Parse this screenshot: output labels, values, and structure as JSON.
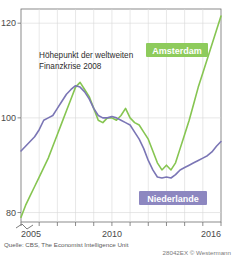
{
  "chart_data": {
    "type": "line",
    "title": "",
    "subtitle": "",
    "xlabel": "",
    "ylabel": "",
    "xlim": [
      2005,
      2016
    ],
    "ylim": [
      78,
      123
    ],
    "yticks": [
      80,
      100,
      120
    ],
    "ytick_labels": [
      "80",
      "100",
      "120"
    ],
    "xticks": [
      2005,
      2006,
      2007,
      2008,
      2009,
      2010,
      2011,
      2012,
      2013,
      2014,
      2015,
      2016
    ],
    "xtick_labels_shown": [
      "2005",
      "2010",
      "2016"
    ],
    "grid": true,
    "legend_position": "inside",
    "y_axis_break": true,
    "annotations": [
      {
        "name": "financial-crisis-note",
        "line1": "Höhepunkt der weltweiten",
        "line2": "Finanzkrise 2008"
      }
    ],
    "series": [
      {
        "name": "Amsterdam",
        "color": "#86c551",
        "label_bg": "#8ecb5c",
        "x": [
          2005.0,
          2005.25,
          2005.5,
          2005.75,
          2006.0,
          2006.25,
          2006.5,
          2006.75,
          2007.0,
          2007.25,
          2007.5,
          2007.75,
          2008.0,
          2008.25,
          2008.5,
          2008.75,
          2009.0,
          2009.25,
          2009.5,
          2009.75,
          2010.0,
          2010.25,
          2010.5,
          2010.75,
          2011.0,
          2011.25,
          2011.5,
          2011.75,
          2012.0,
          2012.25,
          2012.5,
          2012.75,
          2013.0,
          2013.25,
          2013.5,
          2013.75,
          2014.0,
          2014.25,
          2014.5,
          2014.75,
          2015.0,
          2015.25,
          2015.5,
          2015.75,
          2016.0
        ],
        "values": [
          79.0,
          81.5,
          83.5,
          85.5,
          87.5,
          89.5,
          91.5,
          94.0,
          96.5,
          99.0,
          101.5,
          104.0,
          106.5,
          107.5,
          106.0,
          104.5,
          102.0,
          99.5,
          99.0,
          100.0,
          100.0,
          99.5,
          100.5,
          102.0,
          100.0,
          99.0,
          98.5,
          97.0,
          95.5,
          93.0,
          90.5,
          89.0,
          90.0,
          89.0,
          90.5,
          93.5,
          96.5,
          99.5,
          103.0,
          106.5,
          109.5,
          112.5,
          115.5,
          118.5,
          121.5
        ]
      },
      {
        "name": "Niederlande",
        "color": "#7b76b5",
        "label_bg": "#8d87c0",
        "x": [
          2005.0,
          2005.25,
          2005.5,
          2005.75,
          2006.0,
          2006.25,
          2006.5,
          2006.75,
          2007.0,
          2007.25,
          2007.5,
          2007.75,
          2008.0,
          2008.25,
          2008.5,
          2008.75,
          2009.0,
          2009.25,
          2009.5,
          2009.75,
          2010.0,
          2010.25,
          2010.5,
          2010.75,
          2011.0,
          2011.25,
          2011.5,
          2011.75,
          2012.0,
          2012.25,
          2012.5,
          2012.75,
          2013.0,
          2013.25,
          2013.5,
          2013.75,
          2014.0,
          2014.25,
          2014.5,
          2014.75,
          2015.0,
          2015.25,
          2015.5,
          2015.75,
          2016.0
        ],
        "values": [
          93.0,
          94.0,
          95.0,
          96.0,
          97.5,
          99.5,
          100.0,
          100.5,
          102.0,
          103.5,
          105.0,
          106.0,
          106.8,
          106.5,
          105.5,
          104.0,
          102.0,
          100.5,
          100.0,
          100.0,
          100.3,
          100.0,
          99.5,
          99.0,
          98.5,
          97.0,
          95.5,
          93.5,
          91.0,
          89.0,
          87.5,
          87.3,
          87.5,
          87.3,
          88.0,
          89.0,
          89.5,
          90.0,
          90.5,
          91.0,
          91.5,
          92.0,
          92.8,
          94.0,
          95.0
        ]
      }
    ]
  },
  "footer": {
    "source": "Quelle: CBS, The Economist Intelligence Unit",
    "copyright": "28042EX  © Westermann"
  }
}
